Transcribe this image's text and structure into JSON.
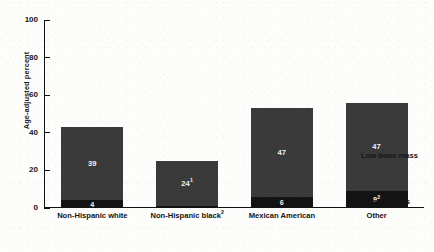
{
  "chart_data": {
    "type": "bar",
    "stacked": true,
    "title": "",
    "xlabel": "",
    "ylabel": "Age-adjusted percent",
    "ylim": [
      0,
      100
    ],
    "yticks": [
      0,
      20,
      40,
      60,
      80,
      100
    ],
    "ytick_labels": [
      "0",
      "20",
      "40",
      "60",
      "80",
      "100"
    ],
    "grid": false,
    "legend_position": "right",
    "categories": [
      "Non-Hispanic white",
      "Non-Hispanic black",
      "Mexican American",
      "Other"
    ],
    "category_labels": [
      {
        "text": "Non-Hispanic white",
        "footnote": ""
      },
      {
        "text": "Non-Hispanic black",
        "footnote": "2"
      },
      {
        "text": "Mexican American",
        "footnote": ""
      },
      {
        "text": "Other",
        "footnote": ""
      }
    ],
    "series": [
      {
        "name": "Osteoporosis",
        "color": "#131313",
        "values": [
          4,
          1,
          6,
          9
        ],
        "labels": [
          {
            "text": "4",
            "footnote": ""
          },
          {
            "text": "",
            "footnote": ""
          },
          {
            "text": "6",
            "footnote": ""
          },
          {
            "text": "9",
            "footnote": "2"
          }
        ]
      },
      {
        "name": "Low bone mass",
        "color": "#3a3a3a",
        "values": [
          39,
          24,
          47,
          47
        ],
        "labels": [
          {
            "text": "39",
            "footnote": ""
          },
          {
            "text": "24",
            "footnote": "1"
          },
          {
            "text": "47",
            "footnote": ""
          },
          {
            "text": "47",
            "footnote": ""
          }
        ]
      }
    ],
    "legend": [
      {
        "label": "Low bone mass",
        "color": "#3a3a3a"
      },
      {
        "label": "Osteoporosis",
        "color": "#131313"
      }
    ]
  },
  "axis": {
    "y_title": "Age-adjusted percent",
    "ticks": [
      "100",
      "80",
      "60",
      "40",
      "20",
      "0"
    ]
  },
  "legend": {
    "low_bone_mass": "Low bone mass",
    "osteoporosis": "Osteoporosis"
  }
}
